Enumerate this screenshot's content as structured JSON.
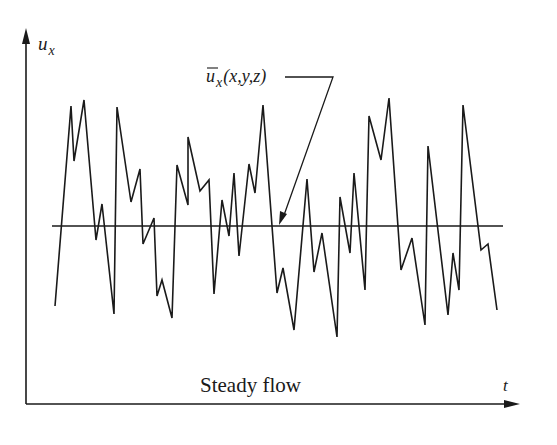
{
  "figure": {
    "y_axis_label": {
      "main": "u",
      "sub": "x"
    },
    "x_axis_label": "t",
    "mean_label": {
      "main": "u",
      "sub": "x",
      "args": "(x,y,z)"
    },
    "caption": "Steady flow",
    "line_color": "#1a1a1a",
    "background": "#ffffff"
  },
  "chart_data": {
    "type": "line",
    "title": "Steady flow",
    "xlabel": "t",
    "ylabel": "u_x",
    "annotation": "ū_x(x,y,z) — time-averaged mean velocity (horizontal line)",
    "mean_level_px": 226,
    "axes_px": {
      "origin": [
        26,
        404
      ],
      "x_end": [
        520,
        404
      ],
      "y_end": [
        26,
        28
      ]
    },
    "grid": false,
    "legend": null,
    "series": [
      {
        "name": "u_x(t) instantaneous",
        "points_px": [
          [
            55,
            306
          ],
          [
            71,
            106
          ],
          [
            74,
            161
          ],
          [
            84,
            100
          ],
          [
            96,
            240
          ],
          [
            102,
            204
          ],
          [
            114,
            314
          ],
          [
            117,
            107
          ],
          [
            131,
            202
          ],
          [
            140,
            169
          ],
          [
            143,
            244
          ],
          [
            154,
            218
          ],
          [
            157,
            296
          ],
          [
            162,
            280
          ],
          [
            172,
            318
          ],
          [
            177,
            165
          ],
          [
            188,
            205
          ],
          [
            188,
            137
          ],
          [
            200,
            191
          ],
          [
            209,
            180
          ],
          [
            214,
            294
          ],
          [
            222,
            200
          ],
          [
            229,
            236
          ],
          [
            234,
            173
          ],
          [
            239,
            256
          ],
          [
            249,
            164
          ],
          [
            255,
            193
          ],
          [
            263,
            105
          ],
          [
            277,
            293
          ],
          [
            283,
            268
          ],
          [
            294,
            330
          ],
          [
            307,
            179
          ],
          [
            314,
            272
          ],
          [
            322,
            233
          ],
          [
            337,
            337
          ],
          [
            340,
            197
          ],
          [
            350,
            253
          ],
          [
            354,
            173
          ],
          [
            365,
            290
          ],
          [
            369,
            116
          ],
          [
            381,
            160
          ],
          [
            389,
            98
          ],
          [
            401,
            270
          ],
          [
            412,
            238
          ],
          [
            425,
            325
          ],
          [
            428,
            146
          ],
          [
            448,
            315
          ],
          [
            453,
            253
          ],
          [
            459,
            290
          ],
          [
            463,
            105
          ],
          [
            481,
            250
          ],
          [
            488,
            244
          ],
          [
            497,
            310
          ]
        ]
      },
      {
        "name": "ū_x(x,y,z) mean",
        "points_px": [
          [
            52,
            226
          ],
          [
            503,
            226
          ]
        ]
      }
    ]
  }
}
